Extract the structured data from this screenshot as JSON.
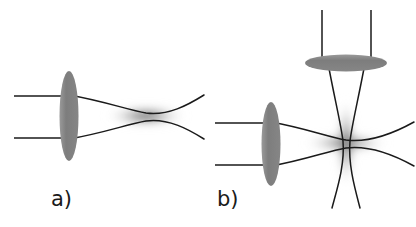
{
  "figure": {
    "type": "diagram",
    "width": 416,
    "height": 227,
    "background_color": "#ffffff"
  },
  "colors": {
    "lens_fill": "#808080",
    "ray_stroke": "#1a1a1a",
    "beam_glow": "#8a8a8a",
    "label_text": "#1a1a1a",
    "background": "#ffffff"
  },
  "panels": [
    {
      "id": "a",
      "label": "a)",
      "label_x": 51,
      "label_y": 189,
      "description": "single-beam focused trap",
      "lenses": [
        {
          "name": "vertical-lens",
          "orientation": "vertical",
          "cx": 69,
          "cy": 116,
          "rx": 9.5,
          "ry": 45
        }
      ],
      "input_rays": [
        {
          "x1": 14,
          "y1": 96,
          "x2": 69,
          "y2": 96
        },
        {
          "x1": 14,
          "y1": 138,
          "x2": 69,
          "y2": 138
        }
      ],
      "beam": {
        "name": "horizontal-beam",
        "axis": "horizontal",
        "start_x": 69,
        "end_x": 204,
        "waist_x": 146,
        "waist_y": 116,
        "half_width_at_lens": 21,
        "half_width_at_waist": 3,
        "half_width_at_end": 16
      },
      "glow": {
        "name": "beam-waist-glow",
        "cx": 146,
        "cy": 116,
        "rx": 44,
        "ry": 13
      }
    },
    {
      "id": "b",
      "label": "b)",
      "label_x": 217,
      "label_y": 189,
      "description": "crossed dual-beam trap",
      "lenses": [
        {
          "name": "vertical-lens",
          "orientation": "vertical",
          "cx": 271,
          "cy": 144,
          "rx": 9.5,
          "ry": 42
        },
        {
          "name": "horizontal-lens",
          "orientation": "horizontal",
          "cx": 346,
          "cy": 63,
          "rx": 41,
          "ry": 8.5
        }
      ],
      "input_rays": [
        {
          "x1": 215,
          "y1": 123,
          "x2": 271,
          "y2": 123
        },
        {
          "x1": 215,
          "y1": 165,
          "x2": 271,
          "y2": 165
        },
        {
          "x1": 322,
          "y1": 10,
          "x2": 322,
          "y2": 62
        },
        {
          "x1": 371,
          "y1": 10,
          "x2": 371,
          "y2": 62
        }
      ],
      "beams": [
        {
          "name": "horizontal-beam",
          "axis": "horizontal",
          "start_x": 271,
          "end_x": 414,
          "waist_x": 346,
          "waist_y": 143,
          "half_width_at_lens": 21,
          "half_width_at_waist": 3,
          "half_width_at_end": 15
        },
        {
          "name": "vertical-beam",
          "axis": "vertical",
          "start_y": 63,
          "end_y": 208,
          "waist_x": 346,
          "waist_y": 143,
          "half_width_at_lens": 18,
          "half_width_at_waist": 3,
          "half_width_at_end": 13
        }
      ],
      "glow": {
        "name": "crossed-waist-glow",
        "cx": 346,
        "cy": 143,
        "horizontal_rx": 46,
        "horizontal_ry": 12,
        "vertical_rx": 12,
        "vertical_ry": 48
      }
    }
  ]
}
